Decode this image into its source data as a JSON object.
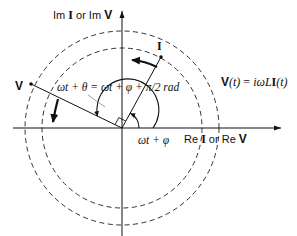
{
  "diagram": {
    "colors": {
      "ink": "#111111",
      "dashed": "#333333",
      "background": "#ffffff"
    },
    "axes": {
      "imag_label_prefix": "Im",
      "imag_label_I": "I",
      "imag_label_mid": "or Im",
      "imag_label_V": "V",
      "real_label_prefix": "Re",
      "real_label_I": "I",
      "real_label_mid": "or Re",
      "real_label_V": "V"
    },
    "phasors": {
      "current_label": "I",
      "voltage_label": "V"
    },
    "angle_labels": {
      "voltage_angle": "ωt + θ = ωt + φ + π/2  rad",
      "current_angle": "ωt + φ"
    },
    "equation": {
      "lhs": "V",
      "lhs_arg": "(t)",
      "eq": " = ",
      "rhs_pre": "iωL",
      "rhs_I": "I",
      "rhs_arg": "(t)"
    },
    "circles": [
      {
        "name": "current-magnitude-circle",
        "r": 80
      },
      {
        "name": "voltage-magnitude-circle",
        "r": 97
      }
    ]
  }
}
